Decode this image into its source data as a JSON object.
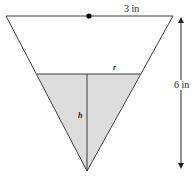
{
  "diagram": {
    "type": "inverted-cone-cross-section",
    "labels": {
      "top_radius": "3 in",
      "height": "6 in",
      "water_radius": "r",
      "water_height": "h"
    },
    "colors": {
      "stroke": "#3a3a3a",
      "water_fill": "#dcdcdc",
      "background": "#ffffff",
      "dot": "#000000"
    }
  }
}
